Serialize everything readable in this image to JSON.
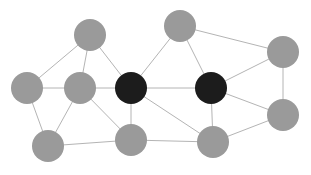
{
  "figure": {
    "kind": "network-graph",
    "title": "",
    "background_color": "#ffffff",
    "width": 311,
    "height": 175
  },
  "style": {
    "edge_color": "#b4b4b4",
    "edge_width": 1,
    "node_radius": 16,
    "node_color_normal": "#9a9a9a",
    "node_color_highlight": "#1c1c1c",
    "node_border_color": "#8e8e8e"
  },
  "graph_data": {
    "type": "node-link-diagram",
    "node_count": 12,
    "edge_count": 21,
    "highlighted_node_count": 2,
    "nodes": [
      {
        "id": "n1",
        "label": "",
        "x": 27,
        "y": 88,
        "r": 16,
        "state": "normal",
        "color": "#9a9a9a"
      },
      {
        "id": "n2",
        "label": "",
        "x": 90,
        "y": 35,
        "r": 16,
        "state": "normal",
        "color": "#9a9a9a"
      },
      {
        "id": "n3",
        "label": "",
        "x": 80,
        "y": 88,
        "r": 16,
        "state": "normal",
        "color": "#9a9a9a"
      },
      {
        "id": "n4",
        "label": "",
        "x": 48,
        "y": 146,
        "r": 16,
        "state": "normal",
        "color": "#9a9a9a"
      },
      {
        "id": "n5",
        "label": "",
        "x": 131,
        "y": 88,
        "r": 16,
        "state": "highlight",
        "color": "#1c1c1c"
      },
      {
        "id": "n6",
        "label": "",
        "x": 131,
        "y": 140,
        "r": 16,
        "state": "normal",
        "color": "#9a9a9a"
      },
      {
        "id": "n7",
        "label": "",
        "x": 180,
        "y": 26,
        "r": 16,
        "state": "normal",
        "color": "#9a9a9a"
      },
      {
        "id": "n8",
        "label": "",
        "x": 211,
        "y": 88,
        "r": 16,
        "state": "highlight",
        "color": "#1c1c1c"
      },
      {
        "id": "n9",
        "label": "",
        "x": 213,
        "y": 142,
        "r": 16,
        "state": "normal",
        "color": "#9a9a9a"
      },
      {
        "id": "n10",
        "label": "",
        "x": 283,
        "y": 52,
        "r": 16,
        "state": "normal",
        "color": "#9a9a9a"
      },
      {
        "id": "n11",
        "label": "",
        "x": 283,
        "y": 115,
        "r": 16,
        "state": "normal",
        "color": "#9a9a9a"
      },
      {
        "id": "n12",
        "label": "",
        "x": 131,
        "y": 88,
        "r": 0,
        "state": "hidden",
        "color": "#1c1c1c"
      }
    ],
    "edges": [
      {
        "source": "n1",
        "target": "n2"
      },
      {
        "source": "n1",
        "target": "n3"
      },
      {
        "source": "n1",
        "target": "n4"
      },
      {
        "source": "n2",
        "target": "n3"
      },
      {
        "source": "n2",
        "target": "n5"
      },
      {
        "source": "n3",
        "target": "n5"
      },
      {
        "source": "n3",
        "target": "n4"
      },
      {
        "source": "n3",
        "target": "n6"
      },
      {
        "source": "n4",
        "target": "n6"
      },
      {
        "source": "n5",
        "target": "n6"
      },
      {
        "source": "n5",
        "target": "n7"
      },
      {
        "source": "n5",
        "target": "n8"
      },
      {
        "source": "n5",
        "target": "n9"
      },
      {
        "source": "n6",
        "target": "n9"
      },
      {
        "source": "n7",
        "target": "n8"
      },
      {
        "source": "n7",
        "target": "n10"
      },
      {
        "source": "n8",
        "target": "n9"
      },
      {
        "source": "n8",
        "target": "n10"
      },
      {
        "source": "n8",
        "target": "n11"
      },
      {
        "source": "n9",
        "target": "n11"
      },
      {
        "source": "n10",
        "target": "n11"
      }
    ]
  }
}
